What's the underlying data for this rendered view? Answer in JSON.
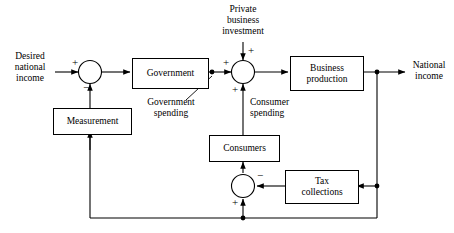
{
  "diagram": {
    "line_color": "#000000",
    "background": "#ffffff",
    "blocks": [
      {
        "id": "government",
        "label": "Government"
      },
      {
        "id": "business-production",
        "label": "Business\nproduction",
        "line1": "Business",
        "line2": "production"
      },
      {
        "id": "measurement",
        "label": "Measurement"
      },
      {
        "id": "consumers",
        "label": "Consumers"
      },
      {
        "id": "tax-collections",
        "label": "Tax\ncollections",
        "line1": "Tax",
        "line2": "collections"
      }
    ],
    "signals": {
      "desired_national_income": {
        "line1": "Desired",
        "line2": "national",
        "line3": "income"
      },
      "private_business_investment": {
        "line1": "Private",
        "line2": "business",
        "line3": "investment"
      },
      "national_income": {
        "line1": "National",
        "line2": "income"
      },
      "government_spending": {
        "line1": "Government",
        "line2": "spending"
      },
      "consumer_spending": {
        "line1": "Consumer",
        "line2": "spending"
      }
    },
    "summing_junctions": [
      {
        "id": "sum-error",
        "signs": [
          "+",
          "-"
        ]
      },
      {
        "id": "sum-demand",
        "signs": [
          "+",
          "+",
          "+"
        ]
      },
      {
        "id": "sum-disposable",
        "signs": [
          "-",
          "+"
        ]
      }
    ],
    "signs": {
      "plus": "+",
      "minus": "−"
    }
  }
}
